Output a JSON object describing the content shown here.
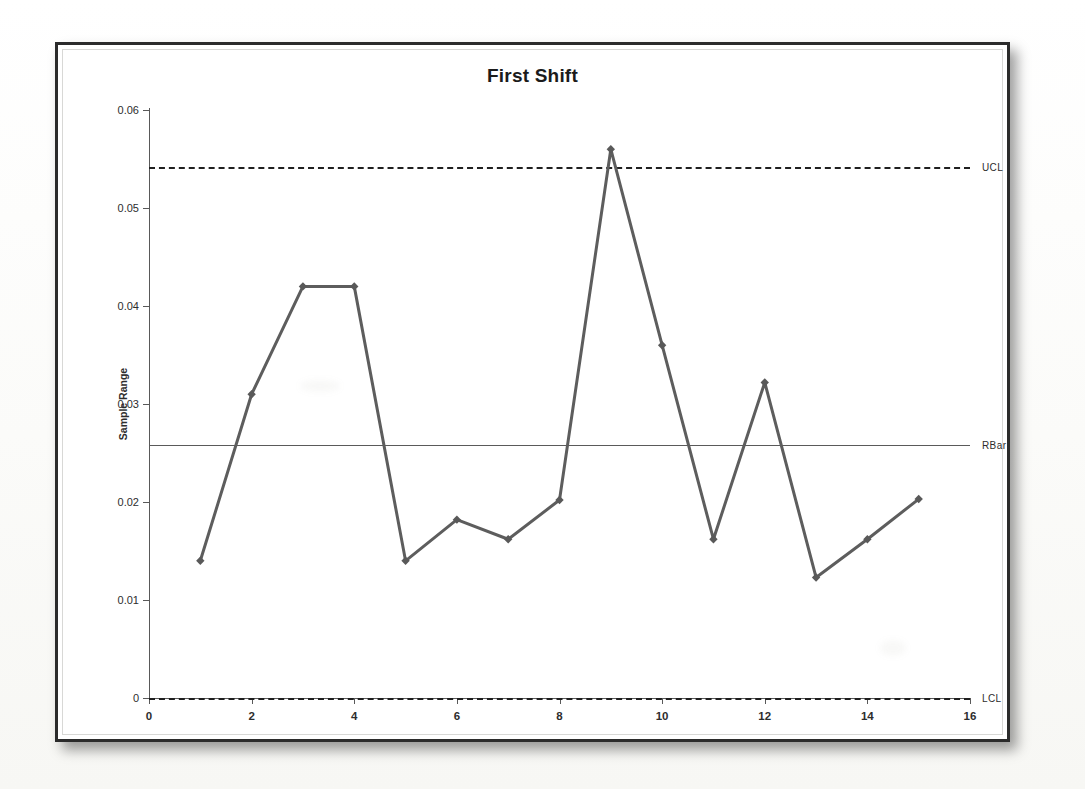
{
  "chart_data": {
    "type": "line",
    "title": "First Shift",
    "subtitle": "",
    "xlabel": "",
    "ylabel": "Sample Range",
    "x": [
      1,
      2,
      3,
      4,
      5,
      6,
      7,
      8,
      9,
      10,
      11,
      12,
      13,
      14,
      15
    ],
    "values": [
      0.014,
      0.031,
      0.042,
      0.042,
      0.014,
      0.0182,
      0.0162,
      0.0202,
      0.056,
      0.036,
      0.0162,
      0.0322,
      0.0123,
      0.0162,
      0.0203
    ],
    "series": [
      {
        "name": "Sample Range",
        "values": [
          0.014,
          0.031,
          0.042,
          0.042,
          0.014,
          0.0182,
          0.0162,
          0.0202,
          0.056,
          0.036,
          0.0162,
          0.0322,
          0.0123,
          0.0162,
          0.0203
        ]
      }
    ],
    "xlim": [
      0,
      16
    ],
    "ylim": [
      0,
      0.06
    ],
    "xticks": [
      0,
      2,
      4,
      6,
      8,
      10,
      12,
      14,
      16
    ],
    "xtick_labels": [
      "0",
      "2",
      "4",
      "6",
      "8",
      "10",
      "12",
      "14",
      "16"
    ],
    "yticks": [
      0,
      0.01,
      0.02,
      0.03,
      0.04,
      0.05,
      0.06
    ],
    "ytick_labels": [
      "0",
      "0.01",
      "0.02",
      "0.03",
      "0.04",
      "0.05",
      "0.06"
    ],
    "grid": false,
    "legend_position": "right-inline",
    "reference_lines": [
      {
        "label": "UCL",
        "value": 0.0542,
        "style": "dashed"
      },
      {
        "label": "RBar",
        "value": 0.0258,
        "style": "solid"
      },
      {
        "label": "LCL",
        "value": 0.0,
        "style": "dashed"
      }
    ],
    "colors": {
      "series_line": "#5d5d5d",
      "marker": "#595959",
      "ucl_line": "#1f1f1f",
      "rbar_line": "#5a5a5a",
      "lcl_line": "#1f1f1f",
      "axis": "#595959",
      "title": "#1b1b1b",
      "frame": "#2b2b2b",
      "background": "#ffffff"
    }
  }
}
